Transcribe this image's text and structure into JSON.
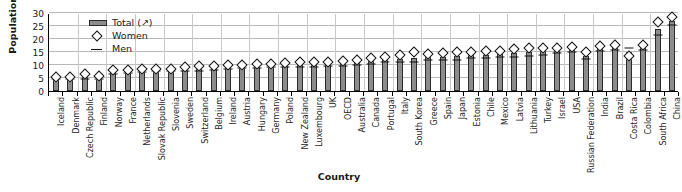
{
  "chart_data": {
    "type": "bar",
    "title": "",
    "xlabel": "Country",
    "ylabel": "Population (%)",
    "ylim": [
      0,
      30
    ],
    "yticks": [
      0,
      5,
      10,
      15,
      20,
      25,
      30
    ],
    "grid": true,
    "legend_position": "top-left",
    "legend": [
      {
        "label": "Total (↗)",
        "marker": "bar-swatch",
        "color": "#8c8c8c"
      },
      {
        "label": "Women",
        "marker": "diamond-open",
        "color": "#ffffff"
      },
      {
        "label": "Men",
        "marker": "dash",
        "color": "#111111"
      }
    ],
    "categories": [
      "Iceland",
      "Denmark",
      "Czech Republic",
      "Finland",
      "Norway",
      "France",
      "Netherlands",
      "Slovak Republic",
      "Slovenia",
      "Sweden",
      "Switzerland",
      "Belgium",
      "Ireland",
      "Austria",
      "Hungary",
      "Germany",
      "Poland",
      "New Zealand",
      "Luxembourg",
      "UK",
      "OECD",
      "Australia",
      "Canada",
      "Portugal",
      "Italy",
      "South Korea",
      "Greece",
      "Spain",
      "Japan",
      "Estonia",
      "Chile",
      "Mexico",
      "Latvia",
      "Lithuania",
      "Turkey",
      "Israel",
      "USA",
      "Russian Federation",
      "India",
      "Brazil",
      "Costa Rica",
      "Colombia",
      "South Africa",
      "China"
    ],
    "series": [
      {
        "name": "Total (↗)",
        "values": [
          5.0,
          5.0,
          5.4,
          5.2,
          7.2,
          7.6,
          7.8,
          8.0,
          8.2,
          8.4,
          8.6,
          9.0,
          9.2,
          9.4,
          9.6,
          9.8,
          10.0,
          10.0,
          10.2,
          10.4,
          10.6,
          11.0,
          11.4,
          12.0,
          12.4,
          12.8,
          13.0,
          13.2,
          13.4,
          13.8,
          14.0,
          14.2,
          14.6,
          15.0,
          15.2,
          15.6,
          16.0,
          13.6,
          16.4,
          16.6,
          15.0,
          16.8,
          24.0,
          27.0
        ]
      },
      {
        "name": "Women",
        "values": [
          5.4,
          5.4,
          6.4,
          5.6,
          8.0,
          8.2,
          8.4,
          8.4,
          8.6,
          9.2,
          9.6,
          9.8,
          10.0,
          10.0,
          10.2,
          10.4,
          10.6,
          11.0,
          11.0,
          11.2,
          11.6,
          12.0,
          12.6,
          13.2,
          14.0,
          15.0,
          14.4,
          14.6,
          15.0,
          15.0,
          15.2,
          15.4,
          16.0,
          16.6,
          16.6,
          16.6,
          17.0,
          15.0,
          17.4,
          17.6,
          13.6,
          17.8,
          26.4,
          28.6
        ]
      },
      {
        "name": "Men",
        "values": [
          4.6,
          4.6,
          4.6,
          4.8,
          6.6,
          7.0,
          7.2,
          7.6,
          7.8,
          7.8,
          7.8,
          8.2,
          8.4,
          8.8,
          9.0,
          9.2,
          9.4,
          9.2,
          9.4,
          9.6,
          9.8,
          10.0,
          10.4,
          11.0,
          11.0,
          11.0,
          11.8,
          12.0,
          12.0,
          12.6,
          12.8,
          13.0,
          13.2,
          13.4,
          13.8,
          14.6,
          15.0,
          12.2,
          15.4,
          15.6,
          16.4,
          15.8,
          21.6,
          25.4
        ]
      }
    ]
  }
}
